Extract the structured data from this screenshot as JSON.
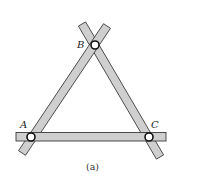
{
  "diagram": {
    "type": "pin-jointed triangular frame of three overlapping bars",
    "caption": "(a)",
    "joints": [
      {
        "id": "A",
        "label": "A"
      },
      {
        "id": "B",
        "label": "B"
      },
      {
        "id": "C",
        "label": "C"
      }
    ],
    "members": [
      {
        "id": "AB",
        "from": "A",
        "to": "B",
        "description": "inclined bar, lower-left to top"
      },
      {
        "id": "BC",
        "from": "B",
        "to": "C",
        "description": "inclined bar, top to lower-right"
      },
      {
        "id": "AC",
        "from": "A",
        "to": "C",
        "description": "horizontal bar at bottom"
      }
    ],
    "colors": {
      "bar_fill": "#cfcfcf",
      "bar_outline": "#3a3a3a",
      "pin_fill": "#ffffff",
      "pin_outline": "#111111",
      "background": "#ffffff"
    }
  }
}
